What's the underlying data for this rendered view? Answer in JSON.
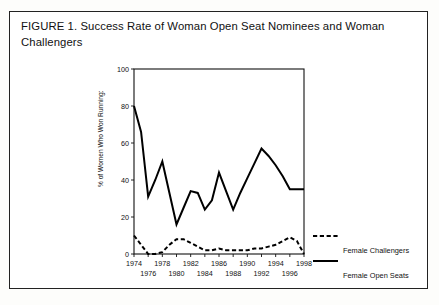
{
  "figure": {
    "title": "FIGURE 1. Success Rate of Woman Open Seat Nominees and Woman Challengers"
  },
  "chart_data": {
    "type": "line",
    "title": "",
    "xlabel": "",
    "ylabel": "% of Women Who Won Running:",
    "xlim": [
      1974,
      1998
    ],
    "ylim": [
      0,
      100
    ],
    "grid": false,
    "legend_position": "right",
    "ytick_labels": [
      "0",
      "20",
      "40",
      "60",
      "80",
      "100"
    ],
    "ytick_values": [
      0,
      20,
      40,
      60,
      80,
      100
    ],
    "xtick_labels_top": [
      "1974",
      "1978",
      "1982",
      "1986",
      "1990",
      "1994",
      "1998"
    ],
    "xtick_labels_bottom": [
      "1976",
      "1980",
      "1984",
      "1988",
      "1992",
      "1996"
    ],
    "xtick_values_top": [
      1974,
      1978,
      1982,
      1986,
      1990,
      1994,
      1998
    ],
    "xtick_values_bottom": [
      1976,
      1980,
      1984,
      1988,
      1992,
      1996
    ],
    "x": [
      1974,
      1975,
      1976,
      1977,
      1978,
      1979,
      1980,
      1981,
      1982,
      1983,
      1984,
      1985,
      1986,
      1987,
      1988,
      1989,
      1990,
      1991,
      1992,
      1993,
      1994,
      1995,
      1996,
      1997,
      1998
    ],
    "series": [
      {
        "name": "Female Open Seats",
        "style": "solid",
        "color": "#000000",
        "values": [
          80,
          66,
          31,
          40,
          50,
          33,
          16,
          25,
          34,
          33,
          24,
          29,
          44,
          34,
          24,
          33,
          41,
          49,
          57,
          53,
          48,
          42,
          35,
          35,
          35
        ]
      },
      {
        "name": "Female Challengers",
        "style": "dashed",
        "color": "#000000",
        "values": [
          10,
          5,
          0,
          0,
          1,
          5,
          8,
          8,
          6,
          4,
          2,
          2,
          3,
          2,
          2,
          2,
          2,
          3,
          3,
          4,
          5,
          7,
          9,
          7,
          0
        ]
      }
    ],
    "legend": [
      {
        "label": "Female Challengers",
        "style": "dashed"
      },
      {
        "label": "Female Open Seats",
        "style": "solid"
      }
    ]
  }
}
